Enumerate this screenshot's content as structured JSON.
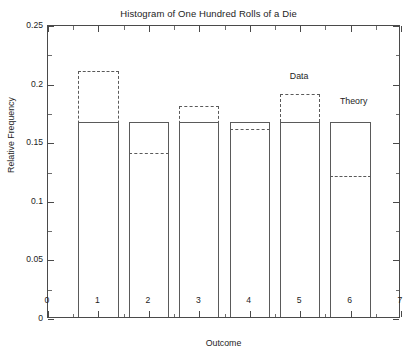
{
  "chart_data": {
    "type": "bar",
    "title": "Histogram of One Hundred Rolls of a Die",
    "xlabel": "Outcome",
    "ylabel": "Relative Frequency",
    "xlim": [
      0,
      7
    ],
    "ylim": [
      0,
      0.25
    ],
    "xticks": [
      "0",
      "1",
      "2",
      "3",
      "4",
      "5",
      "6",
      "7"
    ],
    "xtick_values": [
      0,
      1,
      2,
      3,
      4,
      5,
      6,
      7
    ],
    "yticks": [
      "0",
      "0.05",
      "0.1",
      "0.15",
      "0.2",
      "0.25"
    ],
    "ytick_values": [
      0,
      0.05,
      0.1,
      0.15,
      0.2,
      0.25
    ],
    "grid": false,
    "bar_width": 0.8,
    "categories": [
      1,
      2,
      3,
      4,
      5,
      6
    ],
    "series": [
      {
        "name": "Data",
        "style": "dashed",
        "values": [
          0.21,
          0.14,
          0.18,
          0.16,
          0.19,
          0.12
        ]
      },
      {
        "name": "Theory",
        "style": "solid",
        "values": [
          0.1667,
          0.1667,
          0.1667,
          0.1667,
          0.1667,
          0.1667
        ]
      }
    ],
    "annotations": [
      {
        "text": "Data",
        "x": 5.0,
        "y": 0.2025
      },
      {
        "text": "Theory",
        "x": 6.08,
        "y": 0.1805
      }
    ]
  },
  "caption": {
    "text": ""
  }
}
